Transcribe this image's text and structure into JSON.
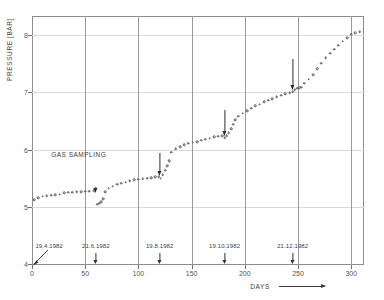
{
  "chart_data": {
    "type": "scatter",
    "title": "",
    "xlabel": "DAYS",
    "ylabel": "PRESSURE [BAR]",
    "xlim": [
      0,
      312
    ],
    "ylim": [
      4,
      8.35
    ],
    "xticks": [
      0,
      50,
      100,
      150,
      200,
      250,
      300
    ],
    "xtick_labels": [
      "0",
      "50",
      "100",
      "150",
      "200",
      "250",
      "300"
    ],
    "yticks": [
      4,
      5,
      6,
      7,
      8
    ],
    "ytick_labels": [
      "4",
      "5",
      "6",
      "7",
      "8"
    ],
    "grid": "vertical gridlines at x ticks 50-300, faint horizontal gridlines at integer bar values",
    "legend": "none",
    "marker": "open circle",
    "annotations": [
      {
        "text": "GAS SAMPLING",
        "x": 18,
        "y": 5.92
      }
    ],
    "event_arrows": [
      {
        "label": "19.4.1982",
        "x": 3
      },
      {
        "label": "21.6.1982",
        "x": 60
      },
      {
        "label": "19.8.1982",
        "x": 120
      },
      {
        "label": "19.10.1982",
        "x": 181
      },
      {
        "label": "21.12.1982",
        "x": 245
      }
    ],
    "series": [
      {
        "name": "pressure",
        "points": [
          [
            2,
            5.16
          ],
          [
            6,
            5.2
          ],
          [
            10,
            5.22
          ],
          [
            14,
            5.23
          ],
          [
            18,
            5.24
          ],
          [
            22,
            5.25
          ],
          [
            26,
            5.26
          ],
          [
            30,
            5.28
          ],
          [
            34,
            5.29
          ],
          [
            38,
            5.29
          ],
          [
            42,
            5.3
          ],
          [
            46,
            5.3
          ],
          [
            50,
            5.31
          ],
          [
            54,
            5.31
          ],
          [
            58,
            5.32
          ],
          [
            61,
            5.08
          ],
          [
            63,
            5.1
          ],
          [
            65,
            5.13
          ],
          [
            67,
            5.18
          ],
          [
            69,
            5.3
          ],
          [
            72,
            5.36
          ],
          [
            76,
            5.4
          ],
          [
            80,
            5.43
          ],
          [
            84,
            5.45
          ],
          [
            88,
            5.47
          ],
          [
            92,
            5.49
          ],
          [
            96,
            5.51
          ],
          [
            100,
            5.52
          ],
          [
            104,
            5.53
          ],
          [
            108,
            5.54
          ],
          [
            112,
            5.55
          ],
          [
            116,
            5.56
          ],
          [
            119,
            5.56
          ],
          [
            121,
            5.54
          ],
          [
            123,
            5.6
          ],
          [
            125,
            5.68
          ],
          [
            127,
            5.76
          ],
          [
            129,
            5.84
          ],
          [
            131,
            5.99
          ],
          [
            135,
            6.05
          ],
          [
            139,
            6.09
          ],
          [
            143,
            6.12
          ],
          [
            147,
            6.15
          ],
          [
            151,
            6.17
          ],
          [
            155,
            6.18
          ],
          [
            159,
            6.2
          ],
          [
            163,
            6.22
          ],
          [
            167,
            6.24
          ],
          [
            171,
            6.26
          ],
          [
            175,
            6.27
          ],
          [
            179,
            6.28
          ],
          [
            181,
            6.25
          ],
          [
            183,
            6.28
          ],
          [
            185,
            6.33
          ],
          [
            187,
            6.4
          ],
          [
            189,
            6.48
          ],
          [
            191,
            6.56
          ],
          [
            194,
            6.62
          ],
          [
            198,
            6.67
          ],
          [
            202,
            6.72
          ],
          [
            206,
            6.76
          ],
          [
            210,
            6.8
          ],
          [
            214,
            6.83
          ],
          [
            218,
            6.87
          ],
          [
            222,
            6.9
          ],
          [
            226,
            6.93
          ],
          [
            230,
            6.96
          ],
          [
            234,
            6.99
          ],
          [
            238,
            7.01
          ],
          [
            242,
            7.03
          ],
          [
            245,
            7.05
          ],
          [
            247,
            7.08
          ],
          [
            249,
            7.11
          ],
          [
            251,
            7.12
          ],
          [
            253,
            7.13
          ],
          [
            256,
            7.2
          ],
          [
            260,
            7.27
          ],
          [
            264,
            7.35
          ],
          [
            268,
            7.45
          ],
          [
            272,
            7.55
          ],
          [
            276,
            7.64
          ],
          [
            280,
            7.72
          ],
          [
            284,
            7.79
          ],
          [
            288,
            7.86
          ],
          [
            292,
            7.93
          ],
          [
            296,
            7.99
          ],
          [
            300,
            8.05
          ],
          [
            304,
            8.08
          ],
          [
            308,
            8.1
          ]
        ]
      }
    ]
  }
}
